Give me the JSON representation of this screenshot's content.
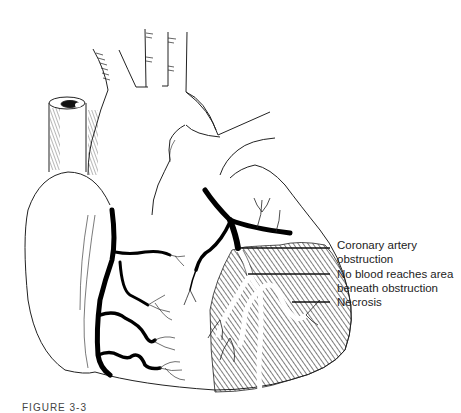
{
  "figure": {
    "caption_partial": "FIGURE 3-3",
    "colors": {
      "ink": "#111111",
      "background": "#ffffff",
      "text": "#222222"
    }
  },
  "labels": [
    {
      "id": "coronary-obstruction",
      "line1": "Coronary artery",
      "line2": "obstruction"
    },
    {
      "id": "no-blood",
      "line1": "No blood reaches area",
      "line2": "beneath obstruction"
    },
    {
      "id": "necrosis",
      "line1": "Necrosis",
      "line2": ""
    }
  ]
}
